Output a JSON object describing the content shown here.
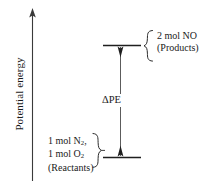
{
  "figure": {
    "type": "potential-energy-diagram",
    "axis": {
      "title": "Potential energy",
      "direction": "up",
      "arrowhead": "up-arrowhead-icon"
    },
    "levels": [
      {
        "id": "products",
        "position": "upper",
        "label_lines": [
          "2 mol NO",
          "(Products)"
        ],
        "brace": "left-curly-brace-icon"
      },
      {
        "id": "reactants",
        "position": "lower",
        "label_lines": [
          "1 mol N2,",
          "1 mol O2",
          "(Reactants)"
        ],
        "brace": "right-curly-brace-icon"
      }
    ],
    "delta": {
      "label": "ΔPE",
      "arrow": "double-headed-vertical-arrow-icon"
    },
    "colors": {
      "ink": "#1a1a1a",
      "background": "#ffffff"
    }
  }
}
